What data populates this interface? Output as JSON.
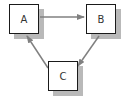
{
  "diagram": {
    "nodes": [
      {
        "id": "A",
        "label": "A",
        "x": 9,
        "y": 4
      },
      {
        "id": "B",
        "label": "B",
        "x": 86,
        "y": 4
      },
      {
        "id": "C",
        "label": "C",
        "x": 48,
        "y": 61
      }
    ],
    "edges": [
      {
        "from": "A",
        "to": "B"
      },
      {
        "from": "B",
        "to": "C"
      },
      {
        "from": "C",
        "to": "A"
      }
    ],
    "colors": {
      "node_border": "#1a1a1a",
      "node_fill": "#ffffff",
      "shadow": "#b9b9b9",
      "edge": "#808080",
      "label": "#333333"
    }
  }
}
